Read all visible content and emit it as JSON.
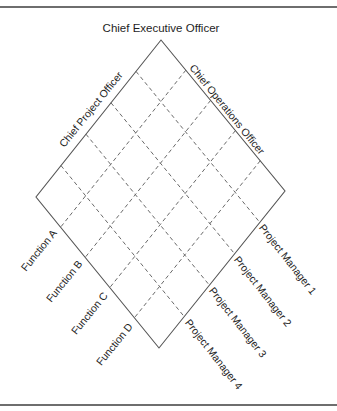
{
  "diagram": {
    "type": "matrix-organization-diamond",
    "title": "Chief Executive Officer",
    "edge_labels": {
      "top_left": "Chief Project Officer",
      "top_right": "Chief Operations Officer"
    },
    "functions": [
      "Function A",
      "Function B",
      "Function C",
      "Function D"
    ],
    "project_managers": [
      "Project Manager 1",
      "Project Manager 2",
      "Project Manager 3",
      "Project Manager 4"
    ],
    "grid": {
      "divisions": 5
    },
    "colors": {
      "edge": "#555555",
      "grid": "#6a6a6a",
      "text": "#1e1e1e",
      "rule": "#6e6e6e"
    }
  }
}
